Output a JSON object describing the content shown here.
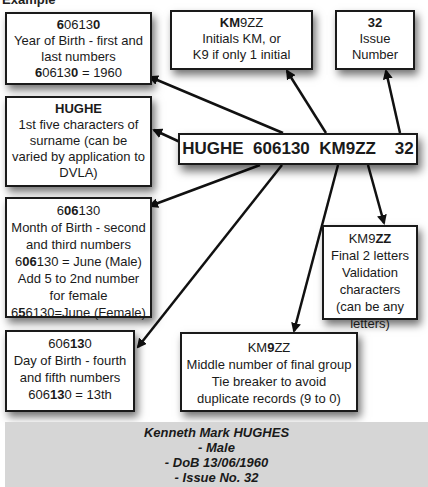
{
  "heading": "Example",
  "licence_number": "HUGHE  606130  KM9ZZ    32",
  "boxes": {
    "year": {
      "code_pre": "",
      "code_bold1": "6",
      "code_mid": "0613",
      "code_bold2": "0",
      "line1": "Year of Birth - first and",
      "line2": "last numbers",
      "eq_bold1": "6",
      "eq_mid": "0613",
      "eq_bold2": "0",
      "eq_tail": " = 1960"
    },
    "initials": {
      "code_bold": "KM",
      "code_rest": "9ZZ",
      "line1": "Initials KM, or",
      "line2": "K9 if only 1 initial"
    },
    "issue": {
      "code": "32",
      "line1": "Issue",
      "line2": "Number"
    },
    "surname": {
      "code": "HUGHE",
      "line1": "1st five characters of",
      "line2": "surname (can be",
      "line3": "varied by application to",
      "line4": "DVLA)"
    },
    "month": {
      "code_pre": "6",
      "code_bold": "06",
      "code_post": "130",
      "line1": "Month of Birth - second",
      "line2": "and third numbers",
      "eq_pre": "6",
      "eq_bold": "06",
      "eq_post": "130 = June (Male)",
      "line3": "Add 5 to 2nd number",
      "line4": "for female",
      "eq2_pre": "6",
      "eq2_bold": "5",
      "eq2_post": "6130=June (Female)"
    },
    "validation": {
      "code_pre": "KM9",
      "code_bold": "ZZ",
      "line1": "Final 2 letters",
      "line2": "Validation",
      "line3": "characters",
      "line4": "(can be any",
      "line5": "letters)"
    },
    "day": {
      "code_pre": "606",
      "code_bold": "13",
      "code_post": "0",
      "line1": "Day of Birth - fourth",
      "line2": "and fifth numbers",
      "eq_pre": "606",
      "eq_bold": "13",
      "eq_post": "0 = 13th"
    },
    "tiebreaker": {
      "code_pre": "KM",
      "code_bold": "9",
      "code_post": "ZZ",
      "line1": "Middle number of final group",
      "line2": "Tie breaker to avoid",
      "line3": "duplicate records (9 to 0)"
    }
  },
  "footer": {
    "line1": "Kenneth Mark HUGHES",
    "line2": "- Male",
    "line3": "- DoB 13/06/1960",
    "line4": "- Issue No. 32"
  },
  "colors": {
    "border": "#1a1a1a",
    "footer_bg": "#d6d6d6",
    "background": "#ffffff"
  }
}
